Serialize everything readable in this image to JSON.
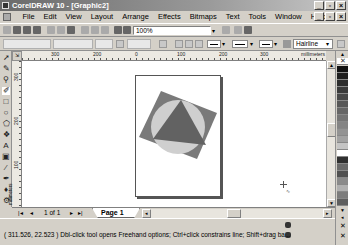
{
  "window": {
    "title": "CorelDRAW 10 - [Graphic2]",
    "controls": {
      "minimize": "_",
      "maximize": "▫",
      "close": "×"
    }
  },
  "menubar": {
    "items": [
      {
        "label": "File"
      },
      {
        "label": "Edit"
      },
      {
        "label": "View"
      },
      {
        "label": "Layout"
      },
      {
        "label": "Arrange"
      },
      {
        "label": "Effects"
      },
      {
        "label": "Bitmaps"
      },
      {
        "label": "Text"
      },
      {
        "label": "Tools"
      },
      {
        "label": "Window"
      },
      {
        "label": "Help"
      }
    ]
  },
  "toolbar": {
    "icons": [
      "new-icon",
      "open-icon",
      "save-icon",
      "print-icon",
      "cut-icon",
      "copy-icon",
      "paste-icon",
      "undo-icon",
      "redo-icon",
      "import-icon",
      "export-icon"
    ],
    "zoom_level": "100%",
    "zoom_dropdown": "▾"
  },
  "propbar": {
    "font_name": "Hairline",
    "dropdown": "▾"
  },
  "rulers": {
    "horizontal": [
      {
        "label": "200",
        "x": 128
      },
      {
        "label": "100",
        "x": 268
      },
      {
        "label": "0",
        "x": 82
      },
      {
        "label": "100",
        "x": 218
      },
      {
        "label": "200",
        "x": 262
      },
      {
        "label": "300",
        "x": 130
      }
    ],
    "h_labels": [
      "300",
      "200",
      "0",
      "100",
      "200",
      "300"
    ],
    "units": "millimeters",
    "vertical": [
      "300",
      "200",
      "100"
    ],
    "v_units": "millimeters"
  },
  "toolbox": {
    "tools": [
      "pick-tool",
      "shape-tool",
      "zoom-tool",
      "freehand-tool",
      "rectangle-tool",
      "ellipse-tool",
      "polygon-tool",
      "basic-shapes-tool",
      "text-tool",
      "interactive-fill-tool",
      "eyedropper-tool",
      "outline-tool",
      "fill-tool",
      "interactive-blend-tool"
    ]
  },
  "canvas": {
    "shapes": {
      "square_color": "#7a7a7a",
      "circle_color": "#cfcfcf",
      "triangle_color": "#626262"
    }
  },
  "pagebar": {
    "first": "|◂",
    "prev": "◂",
    "page_count": "1 of 1",
    "next": "▸",
    "last": "▸|",
    "tab_label": "Page 1"
  },
  "palette": {
    "swatches": [
      "#111111",
      "#1e1e1e",
      "#2c2c2c",
      "#3a3a3a",
      "#484848",
      "#575757",
      "#666666",
      "#757575",
      "#848484",
      "#939393",
      "#a2a2a2",
      "#c4c4c4",
      "#ffffff",
      "#303030",
      "#6a6a6a",
      "#505050",
      "#8a8a8a",
      "#b0b0b0",
      "#7c7c7c",
      "#5e5e5e",
      "#444444",
      "#999999"
    ]
  },
  "status": {
    "coordinates": "( 311.526, 22.523 )",
    "hint": "Dbl-click tool opens Freehand options; Ctrl+click constrains line; Shift+drag ba..."
  }
}
